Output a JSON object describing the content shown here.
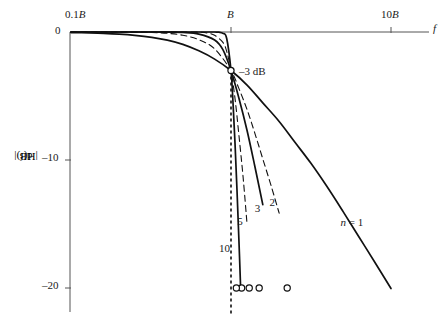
{
  "chart_data": {
    "type": "line",
    "title": "",
    "xlabel": "f",
    "ylabel": "|H(f)|dB",
    "xscale": "log",
    "xlim": [
      0.1,
      10
    ],
    "ylim": [
      -21,
      1
    ],
    "grid": false,
    "legend": "inline-curve-labels",
    "xticks": [
      {
        "value": 0.1,
        "label": "0.1B"
      },
      {
        "value": 1,
        "label": "B"
      },
      {
        "value": 10,
        "label": "10B"
      }
    ],
    "yticks": [
      {
        "value": 0,
        "label": "0"
      },
      {
        "value": -10,
        "label": "–10"
      },
      {
        "value": -20,
        "label": "–20"
      }
    ],
    "annotations": [
      {
        "name": "cutoff-annotation",
        "text": "–3 dB",
        "x": 1,
        "y": -3.01
      },
      {
        "name": "cutoff-marker",
        "shape": "circle",
        "x": 1,
        "y": -3.01
      },
      {
        "name": "cutoff-dashed-line",
        "shape": "vline",
        "x": 1,
        "from_y": -3.01,
        "to_y": -21
      }
    ],
    "series": [
      {
        "name": "n = 1",
        "order": 1,
        "label": "n = 1",
        "style": "solid",
        "label_x": 5.2,
        "label_y": -15.0,
        "marker_x": 2.245,
        "marker_y": -20,
        "x": [
          0.1,
          0.13,
          0.16,
          0.2,
          0.25,
          0.32,
          0.4,
          0.5,
          0.63,
          0.79,
          1.0,
          1.26,
          1.58,
          2.0,
          2.51,
          3.16,
          3.98,
          5.01,
          6.31,
          7.94,
          10.0
        ],
        "y": [
          -0.043,
          -0.073,
          -0.11,
          -0.17,
          -0.263,
          -0.423,
          -0.639,
          -0.969,
          -1.473,
          -2.117,
          -3.01,
          -4.146,
          -5.537,
          -6.99,
          -8.614,
          -10.261,
          -12.076,
          -14.016,
          -16.016,
          -18.009,
          -20.043
        ]
      },
      {
        "name": "n = 2",
        "order": 2,
        "label": "2",
        "style": "dashed",
        "label_x": 1.87,
        "label_y": -13.45,
        "marker_x": 1.5,
        "marker_y": -20,
        "x": [
          0.1,
          0.13,
          0.16,
          0.2,
          0.25,
          0.32,
          0.4,
          0.5,
          0.63,
          0.79,
          1.0,
          1.12,
          1.26,
          1.41,
          1.58,
          1.78,
          2.0
        ],
        "y": [
          -0.0004,
          -0.0012,
          -0.0027,
          -0.0069,
          -0.0169,
          -0.0437,
          -0.1026,
          -0.2526,
          -0.602,
          -1.3185,
          -3.01,
          -4.407,
          -6.062,
          -7.915,
          -9.912,
          -12.002,
          -14.151
        ]
      },
      {
        "name": "n = 3",
        "order": 3,
        "label": "3",
        "style": "solid",
        "label_x": 1.51,
        "label_y": -13.9,
        "marker_x": 1.3,
        "marker_y": -20,
        "x": [
          0.1,
          0.16,
          0.25,
          0.32,
          0.4,
          0.5,
          0.63,
          0.79,
          0.89,
          1.0,
          1.12,
          1.26,
          1.41,
          1.58
        ],
        "y": [
          -0.0,
          -0.0,
          -0.0003,
          -0.0014,
          -0.0069,
          -0.0338,
          -0.1607,
          -0.62,
          -1.38,
          -3.01,
          -5.158,
          -7.698,
          -10.509,
          -13.482
        ]
      },
      {
        "name": "n = 5",
        "order": 5,
        "label": "5",
        "style": "dashed",
        "label_x": 1.175,
        "label_y": -14.9,
        "marker_x": 1.165,
        "marker_y": -20,
        "x": [
          0.1,
          0.25,
          0.4,
          0.5,
          0.63,
          0.71,
          0.79,
          0.89,
          0.94,
          1.0,
          1.06,
          1.12,
          1.19,
          1.26
        ],
        "y": [
          -0.0,
          -0.0,
          -0.0,
          -0.0009,
          -0.0169,
          -0.0764,
          -0.2578,
          -0.8108,
          -1.516,
          -3.01,
          -5.215,
          -8.022,
          -11.33,
          -15.022
        ]
      },
      {
        "name": "n = 10",
        "order": 10,
        "label": "10",
        "style": "solid",
        "label_x": 0.905,
        "label_y": -17.0,
        "marker_x": 1.08,
        "marker_y": -20,
        "x": [
          0.1,
          0.4,
          0.63,
          0.79,
          0.84,
          0.89,
          0.94,
          1.0,
          1.03,
          1.06,
          1.09,
          1.12,
          1.15
        ],
        "y": [
          -0.0,
          -0.0,
          -0.0,
          -0.0016,
          -0.0145,
          -0.1034,
          -0.5072,
          -3.01,
          -5.573,
          -8.761,
          -12.349,
          -16.178,
          -20.17
        ]
      }
    ]
  },
  "axis": {
    "x_label": "f",
    "y_label_main": "|H(f)|",
    "y_label_sub": "dB"
  }
}
